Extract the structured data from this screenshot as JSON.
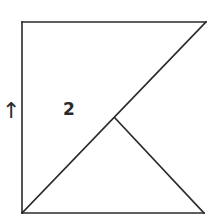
{
  "diagram": {
    "region_label": "2",
    "arrow_glyph": "↑",
    "stroke_color": "#2a2a2a",
    "background": "#ffffff",
    "shapes": {
      "outer_top_edge": [
        [
          22,
          22
        ],
        [
          206,
          22
        ]
      ],
      "outer_left_edge": [
        [
          22,
          22
        ],
        [
          22,
          213
        ]
      ],
      "outer_bottom_edge": [
        [
          22,
          213
        ],
        [
          204,
          213
        ]
      ],
      "main_diagonal": [
        [
          22,
          213
        ],
        [
          206,
          22
        ]
      ],
      "inner_segment": [
        [
          115,
          118
        ],
        [
          204,
          213
        ]
      ]
    }
  }
}
